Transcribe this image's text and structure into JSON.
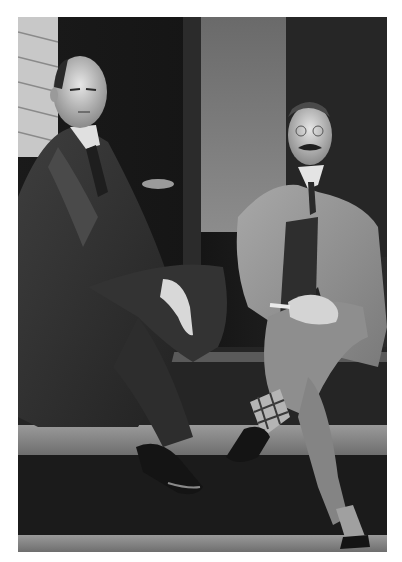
{
  "image": {
    "kind": "black-and-white photograph",
    "border_color": "#ffffff",
    "subjects": [
      {
        "position": "left",
        "description": "bald man in dark suit, seated, hands resting on knee"
      },
      {
        "position": "right",
        "description": "man with mustache in light suit, seated with legs crossed, checkered socks"
      }
    ],
    "setting": "wooden porch steps in front of a house with siding and a dark doorway"
  }
}
